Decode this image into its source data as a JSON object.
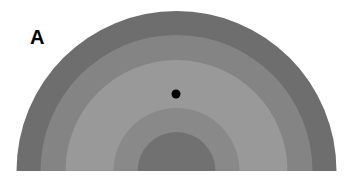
{
  "figure": {
    "panel_label": "A",
    "rings": [
      {
        "name": "outer-band",
        "radius": 160,
        "color": "#6e6e6e"
      },
      {
        "name": "second-band",
        "radius": 136,
        "color": "#848484"
      },
      {
        "name": "third-band",
        "radius": 111,
        "color": "#999999"
      },
      {
        "name": "fourth-band",
        "radius": 63,
        "color": "#898989"
      },
      {
        "name": "inner-disk",
        "radius": 39,
        "color": "#717171"
      }
    ],
    "center": {
      "x": 176.5,
      "y": 171
    },
    "marker": {
      "name": "dot",
      "x": 176,
      "y": 94,
      "radius": 4.5,
      "color": "#000000"
    }
  }
}
